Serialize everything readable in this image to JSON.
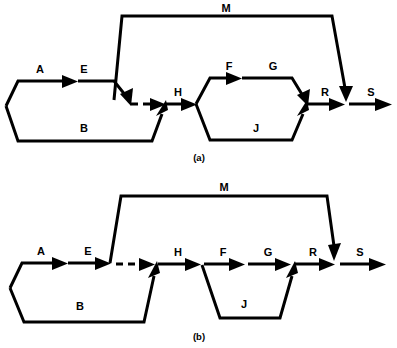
{
  "figure": {
    "title_text": "",
    "panels": [
      {
        "id": "a",
        "caption": "(a)",
        "labels": {
          "M": "M",
          "A": "A",
          "E": "E",
          "B": "B",
          "H": "H",
          "F": "F",
          "G": "G",
          "J": "J",
          "R": "R",
          "S": "S"
        },
        "edges": [
          {
            "name": "A",
            "style": "solid"
          },
          {
            "name": "E",
            "style": "solid"
          },
          {
            "name": "B",
            "style": "solid"
          },
          {
            "name": "M",
            "style": "solid"
          },
          {
            "name": "H",
            "style": "solid"
          },
          {
            "name": "F",
            "style": "solid"
          },
          {
            "name": "G",
            "style": "solid"
          },
          {
            "name": "J",
            "style": "solid"
          },
          {
            "name": "R",
            "style": "solid"
          },
          {
            "name": "S",
            "style": "solid"
          },
          {
            "name": "E-to-H-link",
            "style": "dashed"
          }
        ]
      },
      {
        "id": "b",
        "caption": "(b)",
        "labels": {
          "M": "M",
          "A": "A",
          "E": "E",
          "B": "B",
          "H": "H",
          "F": "F",
          "G": "G",
          "J": "J",
          "R": "R",
          "S": "S"
        },
        "edges": [
          {
            "name": "A",
            "style": "solid"
          },
          {
            "name": "E",
            "style": "solid"
          },
          {
            "name": "B",
            "style": "solid"
          },
          {
            "name": "M",
            "style": "solid"
          },
          {
            "name": "H",
            "style": "solid"
          },
          {
            "name": "F",
            "style": "solid"
          },
          {
            "name": "G",
            "style": "solid"
          },
          {
            "name": "J",
            "style": "solid"
          },
          {
            "name": "R",
            "style": "solid"
          },
          {
            "name": "S",
            "style": "solid"
          },
          {
            "name": "E-to-H-link",
            "style": "dashed"
          }
        ]
      }
    ],
    "colors": {
      "line": "#000000",
      "background": "#ffffff",
      "text": "#000000"
    }
  }
}
